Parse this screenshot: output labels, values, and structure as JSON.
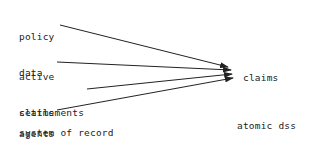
{
  "sources": [
    {
      "id": "policy-data",
      "lines": [
        "policy",
        "data"
      ]
    },
    {
      "id": "active-claims",
      "lines": [
        "active",
        "claims"
      ]
    },
    {
      "id": "settlements",
      "lines": [
        "settlements"
      ]
    },
    {
      "id": "agents",
      "lines": [
        "agents"
      ]
    }
  ],
  "source_footer": "system of record",
  "target": {
    "label": "claims",
    "caption_lines": [
      "atomic dss",
      "level"
    ]
  },
  "edges": [
    {
      "from": "policy-data",
      "to": "claims"
    },
    {
      "from": "active-claims",
      "to": "claims"
    },
    {
      "from": "settlements",
      "to": "claims"
    },
    {
      "from": "agents",
      "to": "claims"
    }
  ]
}
